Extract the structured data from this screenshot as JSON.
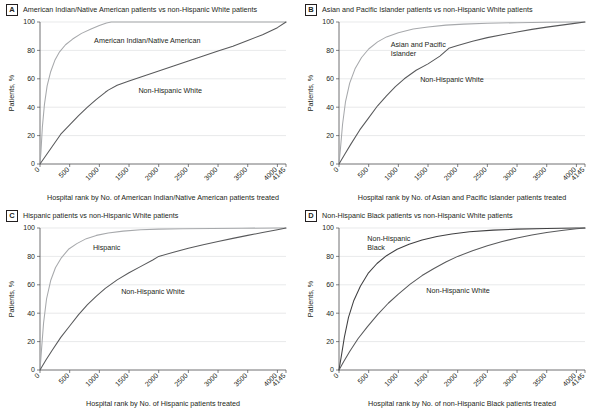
{
  "figure": {
    "panels": [
      {
        "letter": "A",
        "title": "American Indian/Native American patients vs non-Hispanic White patients",
        "xlabel": "Hospital rank by No. of American Indian/Native American patients treated",
        "ylabel": "Patients, %",
        "minority_label_line1": "American Indian/Native American",
        "minority_label_line2": "",
        "white_label_line1": "Non-Hispanic White",
        "white_label_line2": ""
      },
      {
        "letter": "B",
        "title": "Asian and Pacific Islander patients vs non-Hispanic White patients",
        "xlabel": "Hospital rank by No. of Asian and Pacific Islander patients treated",
        "ylabel": "Patients, %",
        "minority_label_line1": "Asian and Pacific",
        "minority_label_line2": "Islander",
        "white_label_line1": "Non-Hispanic White",
        "white_label_line2": ""
      },
      {
        "letter": "C",
        "title": "Hispanic patients vs non-Hispanic White patients",
        "xlabel": "Hospital rank by No. of Hispanic patients treated",
        "ylabel": "Patients, %",
        "minority_label_line1": "Hispanic",
        "minority_label_line2": "",
        "white_label_line1": "Non-Hispanic White",
        "white_label_line2": ""
      },
      {
        "letter": "D",
        "title": "Non-Hispanic Black patients vs non-Hispanic White patients",
        "xlabel": "Hospital rank by No. of non-Hispanic Black patients treated",
        "ylabel": "Patients, %",
        "minority_label_line1": "Non-Hispanic",
        "minority_label_line2": "Black",
        "white_label_line1": "Non-Hispanic White",
        "white_label_line2": ""
      }
    ],
    "colors": {
      "minority_curve": "#a7a9ac",
      "white_curve": "#58595b",
      "axis": "#4d4d4f",
      "grid": "#d9dadb",
      "text": "#231f20"
    }
  },
  "chart_data": [
    {
      "type": "line",
      "panel": "A",
      "title": "American Indian/Native American patients vs non-Hispanic White patients",
      "xlabel": "Hospital rank by No. of American Indian/Native American patients treated",
      "ylabel": "Patients, %",
      "xlim": [
        0,
        4145
      ],
      "ylim": [
        0,
        100
      ],
      "grid": true,
      "legend_position": "inline-annotation",
      "xticks": [
        0,
        500,
        1000,
        1500,
        2000,
        2500,
        3000,
        3500,
        4000,
        4145
      ],
      "xticklabels": [
        "0",
        "500",
        "1000",
        "1500",
        "2000",
        "2500",
        "3000",
        "3500",
        "4000",
        "4145"
      ],
      "yticks": [
        0,
        20,
        40,
        60,
        80,
        100
      ],
      "series": [
        {
          "name": "American Indian/Native American",
          "x": [
            0,
            15,
            40,
            75,
            120,
            180,
            250,
            330,
            430,
            550,
            700,
            860,
            1000,
            1120,
            1200,
            1400,
            2000,
            3000,
            4145
          ],
          "values": [
            0,
            8,
            26,
            42,
            55,
            65,
            73,
            79,
            84,
            88,
            92,
            95,
            97.5,
            99.3,
            100,
            100,
            100,
            100,
            100
          ]
        },
        {
          "name": "Non-Hispanic White",
          "x": [
            0,
            100,
            200,
            350,
            500,
            650,
            800,
            950,
            1100,
            1150,
            1300,
            1500,
            1750,
            2000,
            2250,
            2500,
            2750,
            3000,
            3250,
            3500,
            3750,
            4000,
            4145
          ],
          "values": [
            0,
            6,
            12,
            21,
            27.5,
            34,
            40,
            45.5,
            50.5,
            52,
            55.5,
            58.5,
            62,
            65.5,
            69,
            72.5,
            76,
            79.5,
            83,
            87,
            91,
            96,
            100
          ]
        }
      ]
    },
    {
      "type": "line",
      "panel": "B",
      "title": "Asian and Pacific Islander patients vs non-Hispanic White patients",
      "xlabel": "Hospital rank by No. of Asian and Pacific Islander patients treated",
      "ylabel": "Patients, %",
      "xlim": [
        0,
        4145
      ],
      "ylim": [
        0,
        100
      ],
      "grid": true,
      "legend_position": "inline-annotation",
      "xticks": [
        0,
        500,
        1000,
        1500,
        2000,
        2500,
        3000,
        3500,
        4000,
        4145
      ],
      "xticklabels": [
        "0",
        "500",
        "1000",
        "1500",
        "2000",
        "2500",
        "3000",
        "3500",
        "4000",
        "4145"
      ],
      "yticks": [
        0,
        20,
        40,
        60,
        80,
        100
      ],
      "series": [
        {
          "name": "Asian and Pacific Islander",
          "x": [
            0,
            25,
            60,
            110,
            180,
            270,
            380,
            500,
            650,
            800,
            1000,
            1250,
            1500,
            1800,
            2100,
            2500,
            3000,
            3500,
            4000,
            4145
          ],
          "values": [
            0,
            11,
            28,
            44,
            57,
            67,
            75,
            81,
            86,
            89.5,
            92.5,
            95,
            96.5,
            97.8,
            98.5,
            99.1,
            99.5,
            99.8,
            99.95,
            100
          ]
        },
        {
          "name": "Non-Hispanic White",
          "x": [
            0,
            100,
            200,
            350,
            500,
            650,
            800,
            950,
            1100,
            1300,
            1500,
            1700,
            1850,
            2000,
            2250,
            2500,
            2750,
            3000,
            3250,
            3500,
            3750,
            4000,
            4145
          ],
          "values": [
            0,
            7,
            14,
            24,
            32.5,
            41,
            48,
            54.5,
            60,
            66,
            70.5,
            76,
            81.5,
            83.5,
            86.5,
            89,
            91,
            93,
            94.8,
            96.4,
            97.8,
            99.2,
            100
          ]
        }
      ]
    },
    {
      "type": "line",
      "panel": "C",
      "title": "Hispanic patients vs non-Hispanic White patients",
      "xlabel": "Hospital rank by No. of Hispanic patients treated",
      "ylabel": "Patients, %",
      "xlim": [
        0,
        4145
      ],
      "ylim": [
        0,
        100
      ],
      "grid": true,
      "legend_position": "inline-annotation",
      "xticks": [
        0,
        500,
        1000,
        1500,
        2000,
        2500,
        3000,
        3500,
        4000,
        4145
      ],
      "xticklabels": [
        "0",
        "500",
        "1000",
        "1500",
        "2000",
        "2500",
        "3000",
        "3500",
        "4000",
        "4145"
      ],
      "yticks": [
        0,
        20,
        40,
        60,
        80,
        100
      ],
      "series": [
        {
          "name": "Hispanic",
          "x": [
            0,
            25,
            60,
            110,
            180,
            260,
            360,
            480,
            620,
            780,
            950,
            1150,
            1400,
            1700,
            2000,
            2400,
            2900,
            3400,
            4000,
            4145
          ],
          "values": [
            0,
            14,
            33,
            50,
            63,
            72,
            79,
            85,
            89,
            92.5,
            94.8,
            96.5,
            97.8,
            98.7,
            99.2,
            99.5,
            99.7,
            99.85,
            99.97,
            100
          ]
        },
        {
          "name": "Non-Hispanic White",
          "x": [
            0,
            100,
            200,
            350,
            500,
            650,
            800,
            950,
            1100,
            1300,
            1500,
            1700,
            1900,
            2000,
            2250,
            2500,
            2750,
            3000,
            3250,
            3500,
            3750,
            4000,
            4145
          ],
          "values": [
            0,
            7,
            13.5,
            23,
            31,
            39,
            46,
            52,
            57.5,
            63.5,
            68.5,
            73,
            77.5,
            80,
            83,
            85.8,
            88.2,
            90.5,
            92.7,
            94.8,
            96.8,
            98.8,
            100
          ]
        }
      ]
    },
    {
      "type": "line",
      "panel": "D",
      "title": "Non-Hispanic Black patients vs non-Hispanic White patients",
      "xlabel": "Hospital rank by No. of non-Hispanic Black patients treated",
      "ylabel": "Patients, %",
      "xlim": [
        0,
        4145
      ],
      "ylim": [
        0,
        100
      ],
      "grid": true,
      "legend_position": "inline-annotation",
      "xticks": [
        0,
        500,
        1000,
        1500,
        2000,
        2500,
        3000,
        3500,
        4000,
        4145
      ],
      "xticklabels": [
        "0",
        "500",
        "1000",
        "1500",
        "2000",
        "2500",
        "3000",
        "3500",
        "4000",
        "4145"
      ],
      "yticks": [
        0,
        20,
        40,
        60,
        80,
        100
      ],
      "series": [
        {
          "name": "Non-Hispanic Black",
          "x": [
            0,
            40,
            90,
            160,
            250,
            360,
            490,
            640,
            800,
            980,
            1180,
            1400,
            1650,
            1900,
            2200,
            2600,
            3000,
            3500,
            4000,
            4145
          ],
          "values": [
            0,
            10,
            23,
            37,
            49,
            59,
            68,
            75,
            80.5,
            85,
            88.5,
            91.5,
            94,
            95.8,
            97.3,
            98.5,
            99.2,
            99.7,
            99.95,
            100
          ]
        },
        {
          "name": "Non-Hispanic White",
          "x": [
            0,
            80,
            180,
            320,
            480,
            650,
            830,
            1000,
            1200,
            1400,
            1600,
            1800,
            2000,
            2250,
            2500,
            2750,
            3000,
            3250,
            3500,
            3750,
            4000,
            4145
          ],
          "values": [
            0,
            6,
            13,
            22,
            30.5,
            39,
            47,
            53.5,
            60.5,
            66.5,
            71.5,
            76,
            80,
            84,
            87.5,
            90.5,
            93,
            95,
            96.8,
            98.2,
            99.4,
            100
          ]
        }
      ]
    }
  ]
}
